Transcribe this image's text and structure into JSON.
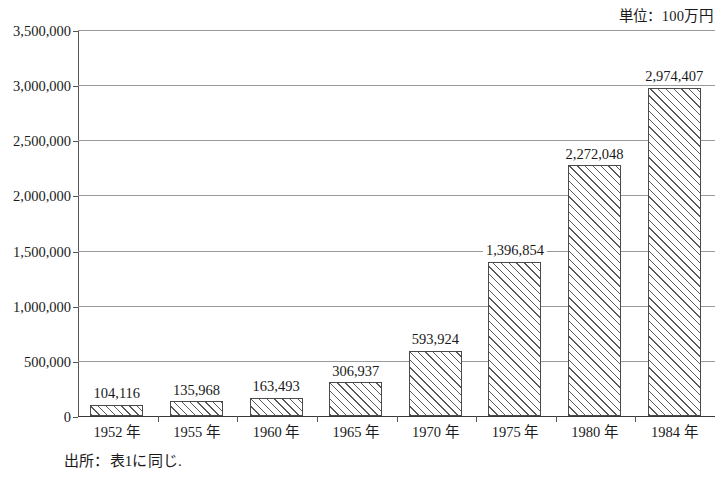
{
  "chart_data": {
    "type": "bar",
    "title": "",
    "subtitle": "",
    "unit_note": "単位：100万円",
    "source_note": "出所：表1に同じ.",
    "xlabel": "",
    "ylabel": "",
    "categories": [
      "1952 年",
      "1955 年",
      "1960 年",
      "1965 年",
      "1970 年",
      "1975 年",
      "1980 年",
      "1984 年"
    ],
    "values": [
      104116,
      135968,
      163493,
      306937,
      593924,
      1396854,
      2272048,
      2974407
    ],
    "value_labels": [
      "104,116",
      "135,968",
      "163,493",
      "306,937",
      "593,924",
      "1,396,854",
      "2,272,048",
      "2,974,407"
    ],
    "ylim": [
      0,
      3500000
    ],
    "ytick_values": [
      0,
      500000,
      1000000,
      1500000,
      2000000,
      2500000,
      3000000,
      3500000
    ],
    "ytick_labels": [
      "0",
      "500,000",
      "1,000,000",
      "1,500,000",
      "2,000,000",
      "2,500,000",
      "3,000,000",
      "3,500,000"
    ],
    "grid": true,
    "legend": "none",
    "bar_fill": "hatch-45",
    "colors": {
      "bar_edge": "#4a4a4a",
      "bar_hatch": "#5a5a5a",
      "gridline": "#9a9a9a",
      "axis": "#555555",
      "text": "#1a1a1a",
      "background": "#ffffff"
    }
  }
}
